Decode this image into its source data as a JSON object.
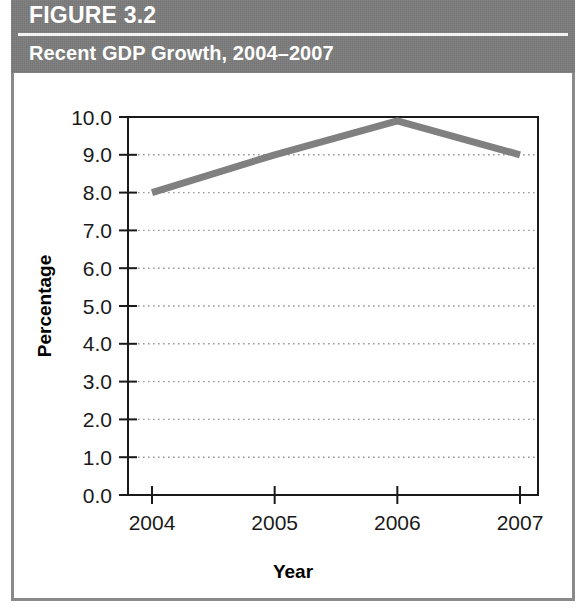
{
  "figure": {
    "label": "FIGURE 3.2",
    "subtitle": "Recent GDP Growth, 2004–2007",
    "header_bg": "#7c7c7c",
    "header_text_color": "#ffffff",
    "frame_color": "#8a8a8a"
  },
  "chart_data": {
    "type": "line",
    "title": "Recent GDP Growth, 2004–2007",
    "xlabel": "Year",
    "ylabel": "Percentage",
    "categories": [
      "2004",
      "2005",
      "2006",
      "2007"
    ],
    "x": [
      2004,
      2005,
      2006,
      2007
    ],
    "values": [
      8.0,
      9.0,
      9.9,
      9.0
    ],
    "series": [
      {
        "name": "GDP Growth",
        "values": [
          8.0,
          9.0,
          9.9,
          9.0
        ],
        "color": "#808080"
      }
    ],
    "ylim": [
      0.0,
      10.0
    ],
    "ytick_labels": [
      "10.0",
      "9.0",
      "8.0",
      "7.0",
      "6.0",
      "5.0",
      "4.0",
      "3.0",
      "2.0",
      "1.0",
      "0.0"
    ],
    "ytick_values": [
      10.0,
      9.0,
      8.0,
      7.0,
      6.0,
      5.0,
      4.0,
      3.0,
      2.0,
      1.0,
      0.0
    ],
    "xtick_labels": [
      "2004",
      "2005",
      "2006",
      "2007"
    ],
    "grid": "horizontal-dotted",
    "legend": "none",
    "line_color": "#808080",
    "axis_color": "#1a1a1a",
    "gridline_color": "#999999"
  }
}
